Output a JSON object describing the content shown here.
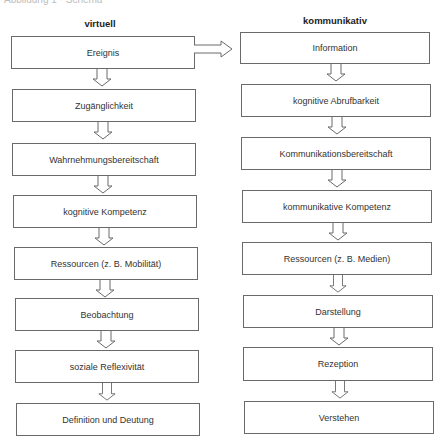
{
  "caption": "Abbildung 1 · Schema",
  "columns": {
    "left": {
      "title": "virtuell",
      "boxes": [
        {
          "label": "Ereignis"
        },
        {
          "label": "Zugänglichkeit"
        },
        {
          "label": "Wahrnehmungsbereitschaft"
        },
        {
          "label": "kognitive Kompetenz"
        },
        {
          "label": "Ressourcen (z. B. Mobilität)"
        },
        {
          "label": "Beobachtung"
        },
        {
          "label": "soziale Reflexivität"
        },
        {
          "label": "Definition und Deutung"
        }
      ]
    },
    "right": {
      "title": "kommunikativ",
      "boxes": [
        {
          "label": "Information"
        },
        {
          "label": "kognitive Abrufbarkeit"
        },
        {
          "label": "Kommunikationsbereitschaft"
        },
        {
          "label": "kommunikative Kompetenz"
        },
        {
          "label": "Ressourcen (z. B. Medien)"
        },
        {
          "label": "Darstellung"
        },
        {
          "label": "Rezeption"
        },
        {
          "label": "Verstehen"
        }
      ]
    }
  },
  "connector": {
    "from": "Ereignis",
    "to": "Information",
    "type": "hollow-arrow-right"
  },
  "colors": {
    "border": "#6a6a6a",
    "text": "#333333",
    "background": "#ffffff"
  }
}
